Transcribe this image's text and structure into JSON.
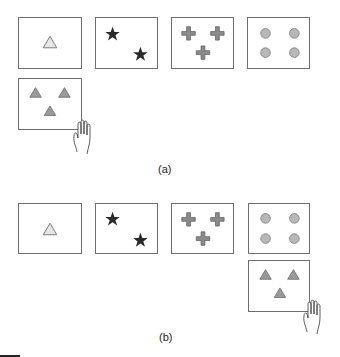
{
  "panels": [
    {
      "id": "a",
      "label": "(a)",
      "cards": [
        {
          "content": "one light triangle"
        },
        {
          "content": "two dark stars"
        },
        {
          "content": "three gray crosses"
        },
        {
          "content": "four gray circles"
        }
      ],
      "dragged_card": {
        "content": "three gray triangles",
        "position": "below first card"
      }
    },
    {
      "id": "b",
      "label": "(b)",
      "cards": [
        {
          "content": "one light triangle"
        },
        {
          "content": "two dark stars"
        },
        {
          "content": "three gray crosses"
        },
        {
          "content": "four gray circles"
        }
      ],
      "dragged_card": {
        "content": "three gray triangles",
        "position": "below fourth card"
      }
    }
  ],
  "colors": {
    "border": "#6e6e6e",
    "light_triangle_fill": "#e6e6e6",
    "gray_fill": "#9a9a9a",
    "circle_fill": "#b8b8b8",
    "star_fill": "#2a2a2a",
    "cross_fill": "#8a8a8a"
  }
}
